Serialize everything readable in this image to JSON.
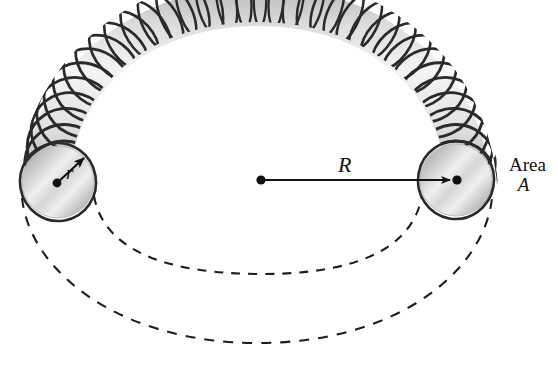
{
  "figure": {
    "kind": "toroid-diagram",
    "background_color": "#ffffff",
    "width": 558,
    "height": 369
  },
  "labels": {
    "minor_radius": "r",
    "major_radius": "R",
    "area_word": "Area",
    "area_symbol": "A"
  },
  "colors": {
    "wire": "#2a2a2a",
    "tube_light": "#f2f2f2",
    "tube_mid": "#c9c9c9",
    "tube_dark": "#9a9a9a",
    "dashed_line": "#1d1d1d",
    "label_text": "#121212",
    "dot": "#101010"
  },
  "geometry": {
    "torus_center": {
      "x": 260,
      "y": 180
    },
    "left_cap_center": {
      "x": 58,
      "y": 182
    },
    "left_cap_radius": 36,
    "right_cap_center": {
      "x": 456,
      "y": 180
    },
    "right_cap_radius": 36,
    "major_radius_px": 196,
    "winding_count": 36,
    "dashed_arc_inner_bottom_y": 272,
    "dashed_arc_outer_bottom_y": 341
  }
}
